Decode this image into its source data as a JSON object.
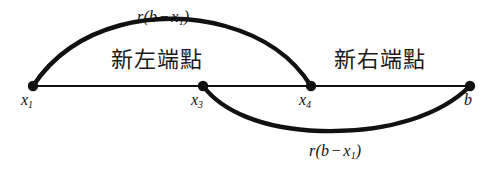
{
  "figure": {
    "type": "number-line-diagram",
    "background_color": "#ffffff",
    "stroke_color": "#111111",
    "baseline_y": 86,
    "width": 493,
    "height": 170
  },
  "axis": {
    "name": "interval-line",
    "start_x": 33,
    "end_x": 470,
    "points": [
      {
        "id": "x1",
        "label_base": "x",
        "label_sub": "1",
        "x": 33,
        "y": 86
      },
      {
        "id": "x3",
        "label_base": "x",
        "label_sub": "3",
        "x": 203,
        "y": 86
      },
      {
        "id": "x4",
        "label_base": "x",
        "label_sub": "4",
        "x": 311,
        "y": 86
      },
      {
        "id": "b",
        "label_base": "b",
        "label_sub": "",
        "x": 470,
        "y": 86
      }
    ]
  },
  "curves": [
    {
      "id": "upper-arc",
      "from": "x1",
      "to": "x4",
      "direction": "above",
      "apex_y": 33,
      "label": {
        "prefix": "r(b",
        "op": "−",
        "var": "x",
        "sub": "1",
        "suffix": ")"
      }
    },
    {
      "id": "lower-arc",
      "from": "x3",
      "to": "b",
      "direction": "below",
      "apex_y": 128,
      "label": {
        "prefix": "r(b",
        "op": "−",
        "var": "x",
        "sub": "1",
        "suffix": ")"
      }
    }
  ],
  "annotations": {
    "left": "新左端點",
    "right": "新右端點"
  }
}
